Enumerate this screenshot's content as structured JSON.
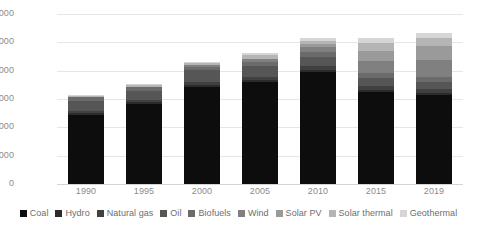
{
  "chart_data": {
    "type": "bar",
    "stacked": true,
    "title": "",
    "subtitle": "",
    "xlabel": "",
    "ylabel": "",
    "categories": [
      "1990",
      "1995",
      "2000",
      "2005",
      "2010",
      "2015",
      "2019"
    ],
    "ylim": [
      0,
      300000
    ],
    "yticks": [
      0,
      50000,
      100000,
      150000,
      200000,
      250000,
      300000
    ],
    "ytick_labels": [
      "0",
      "50,000",
      "100,000",
      "150,000",
      "200,000",
      "250,000",
      "300,000"
    ],
    "grid": true,
    "legend_position": "bottom",
    "series": [
      {
        "name": "Coal",
        "color": "#0d0d0d",
        "values": [
          122000,
          141000,
          172000,
          180000,
          198000,
          162000,
          157000
        ]
      },
      {
        "name": "Hydro",
        "color": "#2b2b2b",
        "values": [
          3000,
          3200,
          3400,
          3500,
          3600,
          3700,
          3800
        ]
      },
      {
        "name": "Natural gas",
        "color": "#404040",
        "values": [
          4000,
          4500,
          5000,
          5500,
          6000,
          7000,
          7500
        ]
      },
      {
        "name": "Oil",
        "color": "#565656",
        "values": [
          18000,
          16000,
          20000,
          19000,
          17000,
          14000,
          12000
        ]
      },
      {
        "name": "Biofuels",
        "color": "#6b6b6b",
        "values": [
          6000,
          6300,
          7000,
          7500,
          8000,
          8500,
          9000
        ]
      },
      {
        "name": "Wind",
        "color": "#808080",
        "values": [
          200,
          600,
          2000,
          4500,
          9000,
          22000,
          30000
        ]
      },
      {
        "name": "Solar PV",
        "color": "#9a9a9a",
        "values": [
          100,
          200,
          400,
          1500,
          5000,
          18000,
          25000
        ]
      },
      {
        "name": "Solar thermal",
        "color": "#b5b5b5",
        "values": [
          2500,
          2700,
          3000,
          6000,
          6500,
          14000,
          14000
        ]
      },
      {
        "name": "Geothermal",
        "color": "#d6d6d6",
        "values": [
          1200,
          1500,
          2200,
          3500,
          3900,
          8900,
          8700
        ]
      }
    ],
    "totals": [
      157000,
      175000,
      215000,
      231000,
      256000,
      258000,
      267000
    ]
  }
}
